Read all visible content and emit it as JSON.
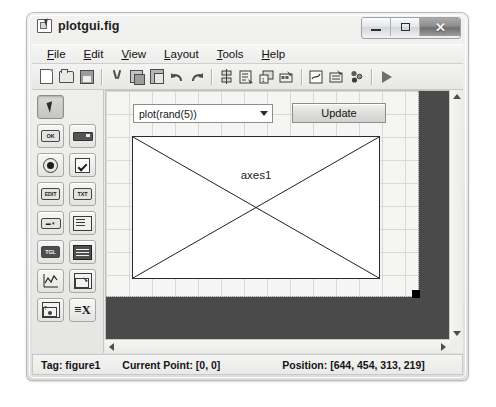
{
  "window": {
    "title": "plotgui.fig",
    "icon": "guide-figure-icon",
    "controls": {
      "minimize": "–",
      "maximize": "□",
      "close": "✕"
    }
  },
  "menubar": {
    "items": [
      {
        "label": "File",
        "accel": "F"
      },
      {
        "label": "Edit",
        "accel": "E"
      },
      {
        "label": "View",
        "accel": "V"
      },
      {
        "label": "Layout",
        "accel": "L"
      },
      {
        "label": "Tools",
        "accel": "T"
      },
      {
        "label": "Help",
        "accel": "H"
      }
    ]
  },
  "toolbar": {
    "items": [
      {
        "name": "new-figure-icon"
      },
      {
        "name": "open-figure-icon"
      },
      {
        "name": "save-figure-icon"
      },
      {
        "name": "separator"
      },
      {
        "name": "cut-icon"
      },
      {
        "name": "copy-icon"
      },
      {
        "name": "paste-icon"
      },
      {
        "name": "undo-icon"
      },
      {
        "name": "redo-icon"
      },
      {
        "name": "separator"
      },
      {
        "name": "align-objects-icon"
      },
      {
        "name": "menu-editor-icon"
      },
      {
        "name": "tab-order-editor-icon"
      },
      {
        "name": "toolbar-editor-icon"
      },
      {
        "name": "separator"
      },
      {
        "name": "m-file-editor-icon"
      },
      {
        "name": "property-inspector-icon"
      },
      {
        "name": "object-browser-icon"
      },
      {
        "name": "separator"
      },
      {
        "name": "run-figure-icon"
      }
    ]
  },
  "palette": {
    "rows": [
      [
        {
          "name": "select-tool",
          "glyph": "arrow",
          "label": "",
          "selected": true
        }
      ],
      [
        {
          "name": "push-button-tool",
          "glyph": "box",
          "label": "OK"
        },
        {
          "name": "slider-tool",
          "glyph": "slider",
          "label": ""
        }
      ],
      [
        {
          "name": "radio-button-tool",
          "glyph": "radio",
          "label": ""
        },
        {
          "name": "checkbox-tool",
          "glyph": "check",
          "label": ""
        }
      ],
      [
        {
          "name": "edit-text-tool",
          "glyph": "box",
          "label": "EDIT"
        },
        {
          "name": "static-text-tool",
          "glyph": "box",
          "label": "TXT"
        }
      ],
      [
        {
          "name": "popup-menu-tool",
          "glyph": "popup",
          "label": ""
        },
        {
          "name": "listbox-tool",
          "glyph": "list",
          "label": ""
        }
      ],
      [
        {
          "name": "toggle-button-tool",
          "glyph": "toggle",
          "label": ""
        },
        {
          "name": "table-tool",
          "glyph": "table",
          "label": ""
        }
      ],
      [
        {
          "name": "axes-tool",
          "glyph": "plot",
          "label": ""
        },
        {
          "name": "panel-tool",
          "glyph": "panel",
          "label": ""
        }
      ],
      [
        {
          "name": "button-group-tool",
          "glyph": "group",
          "label": ""
        },
        {
          "name": "activex-control-tool",
          "glyph": "x",
          "label": ""
        }
      ]
    ]
  },
  "canvas": {
    "popup": {
      "value": "plot(rand(5))",
      "arrow": "chevron-down-icon"
    },
    "update_button": {
      "label": "Update"
    },
    "axes": {
      "label": "axes1"
    },
    "scrollbars": {
      "vertical": {
        "up": "scroll-up-arrow",
        "down": "scroll-down-arrow"
      },
      "horizontal": {
        "left": "scroll-left-arrow",
        "right": "scroll-right-arrow"
      }
    }
  },
  "statusbar": {
    "tag": "Tag: figure1",
    "current_point": "Current Point: [0, 0]",
    "position": "Position: [644, 454, 313, 219]"
  },
  "colors": {
    "window_bg": "#e8e8e6",
    "canvas_bg": "#f5f5f3",
    "outside_bg": "#4a4a4a",
    "axes_bg": "#ffffff",
    "handle": "#000000"
  }
}
